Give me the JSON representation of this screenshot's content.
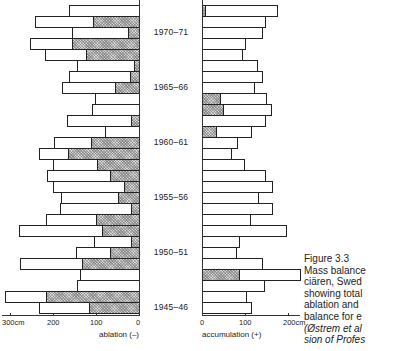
{
  "chart_data": {
    "type": "bar",
    "orientation": "horizontal-butterfly",
    "title": "Figure 3.3",
    "caption_lines": [
      "Mass balance",
      "ciären,  Swed",
      "showing total",
      "ablation  and",
      "balance  for  e",
      "(Østrem et al",
      "sion of Profes"
    ],
    "categories": [
      "1972-73",
      "1971-72",
      "1970-71",
      "1969-70",
      "1968-69",
      "1967-68",
      "1966-67",
      "1965-66",
      "1964-65",
      "1963-64",
      "1962-63",
      "1961-62",
      "1960-61",
      "1959-60",
      "1958-59",
      "1957-58",
      "1956-57",
      "1955-56",
      "1954-55",
      "1953-54",
      "1952-53",
      "1951-52",
      "1950-51",
      "1949-50",
      "1948-49",
      "1947-48",
      "1946-47",
      "1945-46"
    ],
    "year_labels": [
      {
        "label": "1970–71",
        "row": 2
      },
      {
        "label": "1965–66",
        "row": 7
      },
      {
        "label": "1960–61",
        "row": 12
      },
      {
        "label": "1955–56",
        "row": 17
      },
      {
        "label": "1950–51",
        "row": 22
      },
      {
        "label": "1945–46",
        "row": 27
      }
    ],
    "series": [
      {
        "name": "ablation total (cm)",
        "side": "left",
        "values": [
          163,
          242,
          156,
          253,
          219,
          144,
          163,
          179,
          102,
          109,
          167,
          79,
          198,
          233,
          200,
          214,
          200,
          181,
          184,
          216,
          279,
          105,
          147,
          277,
          137,
          144,
          312,
          233
        ]
      },
      {
        "name": "ablation hatched portion (cm)",
        "side": "left",
        "values": [
          0,
          107,
          26,
          156,
          123,
          12,
          21,
          56,
          0,
          0,
          19,
          0,
          112,
          165,
          98,
          67,
          35,
          49,
          19,
          100,
          86,
          19,
          67,
          133,
          0,
          0,
          216,
          116
        ]
      },
      {
        "name": "accumulation total (cm)",
        "side": "right",
        "values": [
          177,
          149,
          142,
          102,
          95,
          130,
          142,
          123,
          151,
          163,
          149,
          116,
          84,
          70,
          100,
          149,
          165,
          133,
          165,
          114,
          198,
          88,
          81,
          142,
          230,
          147,
          105,
          116
        ]
      },
      {
        "name": "accumulation hatched portion (cm)",
        "side": "right",
        "values": [
          9,
          0,
          0,
          0,
          0,
          0,
          0,
          0,
          44,
          51,
          0,
          35,
          0,
          0,
          0,
          0,
          0,
          0,
          0,
          0,
          0,
          0,
          0,
          0,
          88,
          0,
          0,
          0
        ]
      }
    ],
    "xaxis_left": {
      "label": "ablation  (–)",
      "ticks": [
        "300cm",
        "200",
        "100",
        "0"
      ],
      "range": [
        0,
        300
      ]
    },
    "xaxis_right": {
      "label": "accumulation  (+)",
      "ticks": [
        "0",
        "100",
        "200cm"
      ],
      "range": [
        0,
        200
      ]
    },
    "grid": false
  },
  "labels": {
    "fig": "Figure 3.3",
    "cap": [
      "Mass balance",
      "ciären,  Swed",
      "showing total",
      "ablation  and",
      "balance  for  e",
      "(Østrem et al",
      "sion of Profes"
    ],
    "ticks_left": [
      "300cm",
      "200",
      "100",
      "0"
    ],
    "ticks_right": [
      "0",
      "100",
      "200cm"
    ],
    "ablation_label": "ablation  (–)",
    "accumulation_label": "accumulation  (+)"
  }
}
